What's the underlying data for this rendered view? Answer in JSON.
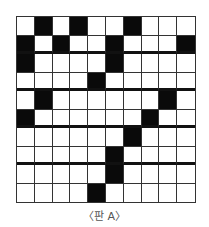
{
  "board": {
    "name": "판 A",
    "rows": 10,
    "cols": 10,
    "black_cells": [
      [
        0,
        1
      ],
      [
        0,
        3
      ],
      [
        0,
        6
      ],
      [
        1,
        0
      ],
      [
        1,
        2
      ],
      [
        1,
        5
      ],
      [
        1,
        9
      ],
      [
        2,
        0
      ],
      [
        2,
        5
      ],
      [
        3,
        4
      ],
      [
        4,
        1
      ],
      [
        4,
        8
      ],
      [
        5,
        0
      ],
      [
        5,
        7
      ],
      [
        6,
        6
      ],
      [
        7,
        5
      ],
      [
        8,
        5
      ],
      [
        9,
        4
      ]
    ],
    "thick_row_separators_after": [
      1,
      3,
      5,
      7
    ],
    "colors": {
      "filled": "#0a0a0a",
      "empty": "#ffffff",
      "grid": "#333333"
    }
  },
  "caption": "〈판 A〉"
}
